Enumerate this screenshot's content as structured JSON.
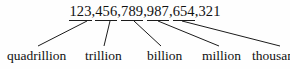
{
  "diagram": {
    "type": "place-value-breakdown",
    "number": {
      "full_text": "123,456,789,987,654,321",
      "groups": [
        "123",
        "456",
        "789",
        "987",
        "654",
        "321"
      ],
      "separator": ",",
      "underlined_groups": [
        "123",
        "456",
        "789",
        "987",
        "654"
      ]
    },
    "labels": [
      {
        "id": "quadrillion",
        "text": "quadrillion",
        "group": "123"
      },
      {
        "id": "trillion",
        "text": "trillion",
        "group": "456"
      },
      {
        "id": "billion",
        "text": "billion",
        "group": "789"
      },
      {
        "id": "million",
        "text": "million",
        "group": "987"
      },
      {
        "id": "thousand",
        "text": "thousand",
        "group": "654"
      }
    ],
    "colors": {
      "background": "#fefefe",
      "text": "#111111",
      "line": "#1b1b1b"
    },
    "connectors": [
      {
        "from_label": "quadrillion",
        "x1": 87,
        "y1": 21,
        "x2": 38,
        "y2": 46
      },
      {
        "from_label": "trillion",
        "x1": 110,
        "y1": 21,
        "x2": 104,
        "y2": 46
      },
      {
        "from_label": "billion",
        "x1": 134,
        "y1": 21,
        "x2": 161,
        "y2": 46
      },
      {
        "from_label": "million",
        "x1": 158,
        "y1": 21,
        "x2": 219,
        "y2": 46
      },
      {
        "from_label": "thousand",
        "x1": 182,
        "y1": 21,
        "x2": 280,
        "y2": 46
      }
    ]
  }
}
